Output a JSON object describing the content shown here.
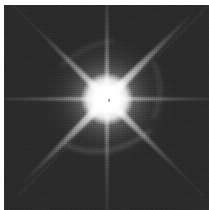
{
  "image": {
    "kind": "astronomical-image",
    "subject": "bright saturated star with eight diffraction spikes",
    "alt_text": "Grayscale astronomical image of a single overexposed star showing an eight-pointed diffraction spike pattern on a noisy dark sky background",
    "width": 209,
    "height": 210,
    "caption": ""
  },
  "frame": {
    "left": 4,
    "top": 5,
    "width": 205,
    "height": 205,
    "border_color": "#ffffff",
    "background_color": "#2b2b2b"
  },
  "chart_data": {
    "type": "heatmap",
    "title": "",
    "xlabel": "",
    "ylabel": "",
    "colormap": "grayscale",
    "background_level": 0.17,
    "peak_level": 1.0,
    "star": {
      "center_x": 103,
      "center_y": 94,
      "core_radius": 13,
      "halo_radius": 66,
      "saturated": true,
      "dead_pixel_offset_x": 2,
      "dead_pixel_offset_y": 1
    },
    "spikes": [
      {
        "name": "spike-north",
        "angle_deg": 90,
        "length": 118,
        "half_width": 2.2,
        "intensity": 0.78
      },
      {
        "name": "spike-south",
        "angle_deg": 270,
        "length": 118,
        "half_width": 2.2,
        "intensity": 0.72
      },
      {
        "name": "spike-east",
        "angle_deg": 0,
        "length": 118,
        "half_width": 2.2,
        "intensity": 0.8
      },
      {
        "name": "spike-west",
        "angle_deg": 180,
        "length": 118,
        "half_width": 2.2,
        "intensity": 0.78
      },
      {
        "name": "spike-northeast",
        "angle_deg": 45,
        "length": 132,
        "half_width": 4.5,
        "intensity": 0.95
      },
      {
        "name": "spike-southwest",
        "angle_deg": 225,
        "length": 132,
        "half_width": 4.5,
        "intensity": 0.92
      },
      {
        "name": "spike-northwest",
        "angle_deg": 135,
        "length": 112,
        "half_width": 4.0,
        "intensity": 0.88
      },
      {
        "name": "spike-southeast",
        "angle_deg": 315,
        "length": 124,
        "half_width": 4.0,
        "intensity": 0.85
      }
    ]
  },
  "colors": {
    "page_background": "#ffffff",
    "sky_background": "#2b2b2b",
    "sky_noise_light": "#3a3a3a",
    "sky_noise_dark": "#202020",
    "halo_mid": "#8d8d8d",
    "core": "#ffffff",
    "dead_pixel": "#6e6e6e"
  }
}
